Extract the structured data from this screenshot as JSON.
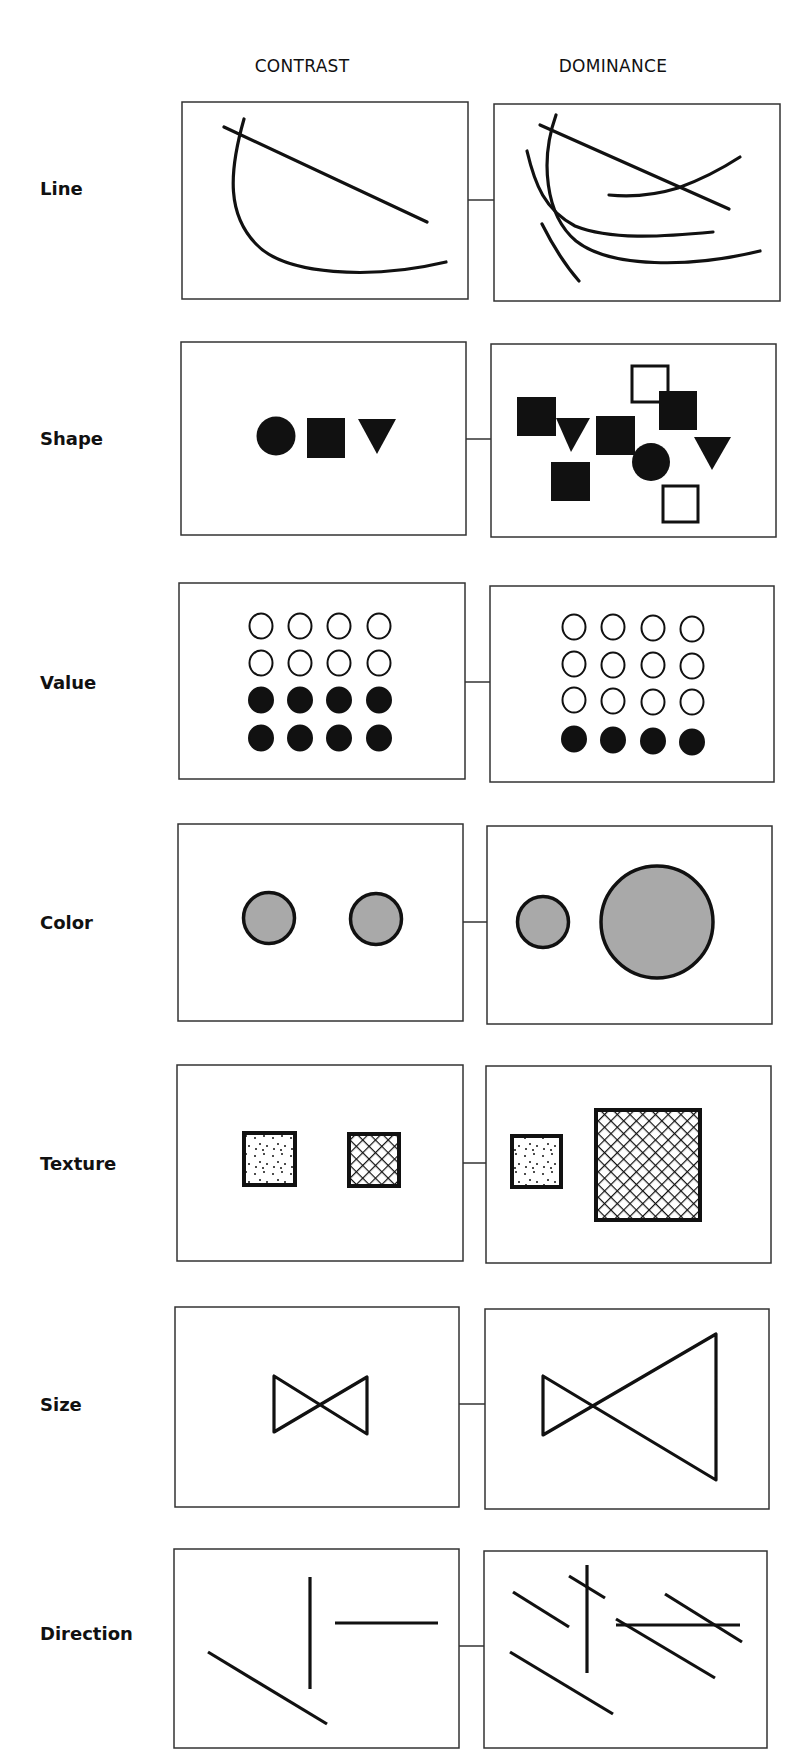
{
  "columns": {
    "contrast": "CONTRAST",
    "dominance": "DOMINANCE"
  },
  "rows": [
    {
      "label": "Line",
      "y": 188
    },
    {
      "label": "Shape",
      "y": 438
    },
    {
      "label": "Value",
      "y": 682
    },
    {
      "label": "Color",
      "y": 922
    },
    {
      "label": "Texture",
      "y": 1163
    },
    {
      "label": "Size",
      "y": 1404
    },
    {
      "label": "Direction",
      "y": 1633
    }
  ],
  "colors": {
    "ink": "#111111",
    "frame": "#333333",
    "gray_fill": "#a9a9a9",
    "paper": "#ffffff"
  }
}
